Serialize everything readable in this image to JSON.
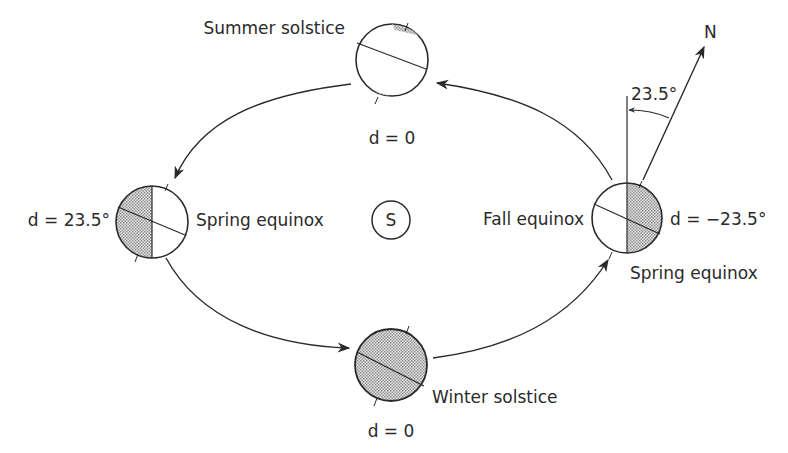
{
  "diagram": {
    "sun": {
      "label": "S"
    },
    "axis": {
      "north_label": "N",
      "tilt_label": "23.5°"
    },
    "positions": {
      "summer_solstice": {
        "label": "Summer solstice",
        "declination": "d = 0"
      },
      "left_equinox": {
        "label": "Spring equinox",
        "declination": "d = 23.5°"
      },
      "winter_solstice": {
        "label": "Winter solstice",
        "declination": "d = 0"
      },
      "right_equinox": {
        "label_left": "Fall equinox",
        "label_below": "Spring equinox",
        "declination": "d = −23.5°"
      }
    },
    "colors": {
      "line": "#2a2a2a",
      "shade": "#c8c8c8",
      "background": "#ffffff"
    }
  }
}
